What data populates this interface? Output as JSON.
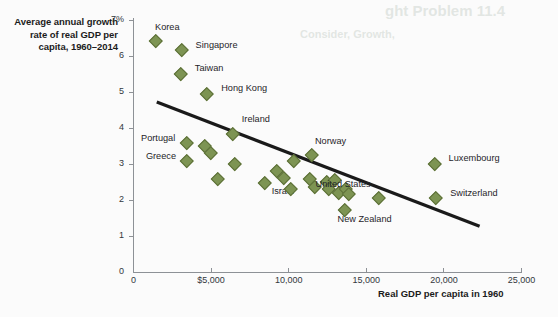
{
  "chart_data": {
    "type": "scatter",
    "title": "",
    "ylabel": "Average annual growth rate of real GDP per capita, 1960–2014",
    "xlabel": "Real GDP per capita in 1960",
    "xlim": [
      0,
      25000
    ],
    "ylim": [
      0,
      7
    ],
    "grid": false,
    "legend": null,
    "x_ticks": [
      "0",
      "$5,000",
      "10,000",
      "15,000",
      "20,000",
      "25,000"
    ],
    "x_tick_values": [
      0,
      5000,
      10000,
      15000,
      20000,
      25000
    ],
    "y_ticks": [
      "0",
      "1",
      "2",
      "3",
      "4",
      "5",
      "6",
      "7%"
    ],
    "y_tick_values": [
      0,
      1,
      2,
      3,
      4,
      5,
      6,
      7
    ],
    "marker_color": "#7d9453",
    "marker_edge_color": "#5d7038",
    "marker_shape": "diamond",
    "trendline": {
      "type": "linear",
      "x_start": 1500,
      "y_start": 4.72,
      "x_end": 22300,
      "y_end": 1.27,
      "color": "#1a1a1a",
      "width": 3.2
    },
    "points": [
      {
        "label": "Korea",
        "x": 1450,
        "y": 6.42,
        "label_dx": -6,
        "label_dy": -13,
        "label_anchor": "left"
      },
      {
        "label": "Singapore",
        "x": 3100,
        "y": 6.18,
        "label_dx": 9,
        "label_dy": -4,
        "label_anchor": "left"
      },
      {
        "label": "Taiwan",
        "x": 3050,
        "y": 5.52,
        "label_dx": 9,
        "label_dy": -4,
        "label_anchor": "left"
      },
      {
        "label": "Hong Kong",
        "x": 4750,
        "y": 4.96,
        "label_dx": 9,
        "label_dy": -4,
        "label_anchor": "left"
      },
      {
        "label": "Ireland",
        "x": 6400,
        "y": 3.83,
        "label_dx": 4,
        "label_dy": -14,
        "label_anchor": "left"
      },
      {
        "label": "Portugal",
        "x": 3400,
        "y": 3.58,
        "label_dx": -11,
        "label_dy": -4,
        "label_anchor": "right"
      },
      {
        "label": "Greece",
        "x": 3450,
        "y": 3.08,
        "label_dx": -11,
        "label_dy": -4,
        "label_anchor": "right"
      },
      {
        "label": "",
        "x": 4600,
        "y": 3.52,
        "label_dx": 0,
        "label_dy": 0,
        "label_anchor": "left"
      },
      {
        "label": "",
        "x": 4950,
        "y": 3.32,
        "label_dx": 0,
        "label_dy": 0,
        "label_anchor": "left"
      },
      {
        "label": "",
        "x": 5450,
        "y": 2.6,
        "label_dx": 0,
        "label_dy": 0,
        "label_anchor": "left"
      },
      {
        "label": "",
        "x": 6550,
        "y": 3.02,
        "label_dx": 0,
        "label_dy": 0,
        "label_anchor": "left"
      },
      {
        "label": "Israel",
        "x": 8450,
        "y": 2.48,
        "label_dx": 2,
        "label_dy": 9,
        "label_anchor": "left"
      },
      {
        "label": "",
        "x": 9200,
        "y": 2.8,
        "label_dx": 0,
        "label_dy": 0,
        "label_anchor": "left"
      },
      {
        "label": "",
        "x": 9650,
        "y": 2.62,
        "label_dx": 0,
        "label_dy": 0,
        "label_anchor": "left"
      },
      {
        "label": "",
        "x": 10150,
        "y": 2.32,
        "label_dx": 0,
        "label_dy": 0,
        "label_anchor": "left"
      },
      {
        "label": "",
        "x": 10300,
        "y": 3.08,
        "label_dx": 0,
        "label_dy": 0,
        "label_anchor": "left"
      },
      {
        "label": "Norway",
        "x": 11500,
        "y": 3.25,
        "label_dx": -2,
        "label_dy": -13,
        "label_anchor": "left"
      },
      {
        "label": "",
        "x": 11350,
        "y": 2.58,
        "label_dx": 0,
        "label_dy": 0,
        "label_anchor": "left"
      },
      {
        "label": "",
        "x": 11700,
        "y": 2.38,
        "label_dx": 0,
        "label_dy": 0,
        "label_anchor": "left"
      },
      {
        "label": "",
        "x": 12450,
        "y": 2.52,
        "label_dx": 0,
        "label_dy": 0,
        "label_anchor": "left"
      },
      {
        "label": "",
        "x": 12600,
        "y": 2.32,
        "label_dx": 0,
        "label_dy": 0,
        "label_anchor": "left"
      },
      {
        "label": "",
        "x": 12950,
        "y": 2.56,
        "label_dx": 0,
        "label_dy": 0,
        "label_anchor": "left"
      },
      {
        "label": "",
        "x": 13200,
        "y": 2.2,
        "label_dx": 0,
        "label_dy": 0,
        "label_anchor": "left"
      },
      {
        "label": "",
        "x": 13650,
        "y": 2.3,
        "label_dx": 0,
        "label_dy": 0,
        "label_anchor": "left"
      },
      {
        "label": "",
        "x": 13900,
        "y": 2.18,
        "label_dx": 0,
        "label_dy": 0,
        "label_anchor": "left"
      },
      {
        "label": "New Zealand",
        "x": 13600,
        "y": 1.72,
        "label_dx": -12,
        "label_dy": 10,
        "label_anchor": "left"
      },
      {
        "label": "United States",
        "x": 15800,
        "y": 2.06,
        "label_dx": -8,
        "label_dy": -13,
        "label_anchor": "right"
      },
      {
        "label": "Luxembourg",
        "x": 19400,
        "y": 3.02,
        "label_dx": 9,
        "label_dy": -4,
        "label_anchor": "left"
      },
      {
        "label": "Switzerland",
        "x": 19500,
        "y": 2.06,
        "label_dx": 9,
        "label_dy": -4,
        "label_anchor": "left"
      }
    ]
  },
  "ghost_text": {
    "line1": "ght Problem 11.4",
    "line2": "Consider, Growth,"
  }
}
